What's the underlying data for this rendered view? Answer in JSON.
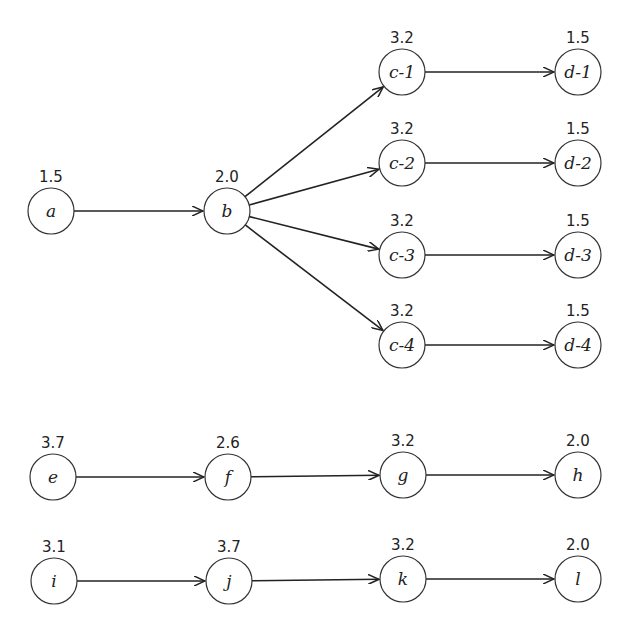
{
  "diagram": {
    "type": "directed-graph",
    "node_radius": 23,
    "nodes": [
      {
        "id": "a",
        "label": "a",
        "weight": "1.5",
        "x": 51,
        "y": 211
      },
      {
        "id": "b",
        "label": "b",
        "weight": "2.0",
        "x": 227,
        "y": 211
      },
      {
        "id": "c-1",
        "label": "c-1",
        "weight": "3.2",
        "x": 402,
        "y": 72
      },
      {
        "id": "c-2",
        "label": "c-2",
        "weight": "3.2",
        "x": 402,
        "y": 163
      },
      {
        "id": "c-3",
        "label": "c-3",
        "weight": "3.2",
        "x": 402,
        "y": 255
      },
      {
        "id": "c-4",
        "label": "c-4",
        "weight": "3.2",
        "x": 402,
        "y": 345
      },
      {
        "id": "d-1",
        "label": "d-1",
        "weight": "1.5",
        "x": 578,
        "y": 72
      },
      {
        "id": "d-2",
        "label": "d-2",
        "weight": "1.5",
        "x": 578,
        "y": 163
      },
      {
        "id": "d-3",
        "label": "d-3",
        "weight": "1.5",
        "x": 578,
        "y": 255
      },
      {
        "id": "d-4",
        "label": "d-4",
        "weight": "1.5",
        "x": 578,
        "y": 345
      },
      {
        "id": "e",
        "label": "e",
        "weight": "3.7",
        "x": 53,
        "y": 477
      },
      {
        "id": "f",
        "label": "f",
        "weight": "2.6",
        "x": 228,
        "y": 477
      },
      {
        "id": "g",
        "label": "g",
        "weight": "3.2",
        "x": 403,
        "y": 475
      },
      {
        "id": "h",
        "label": "h",
        "weight": "2.0",
        "x": 578,
        "y": 475
      },
      {
        "id": "i",
        "label": "i",
        "weight": "3.1",
        "x": 54,
        "y": 581
      },
      {
        "id": "j",
        "label": "j",
        "weight": "3.7",
        "x": 229,
        "y": 581
      },
      {
        "id": "k",
        "label": "k",
        "weight": "3.2",
        "x": 403,
        "y": 579
      },
      {
        "id": "l",
        "label": "l",
        "weight": "2.0",
        "x": 578,
        "y": 579
      }
    ],
    "edges": [
      {
        "from": "a",
        "to": "b"
      },
      {
        "from": "b",
        "to": "c-1"
      },
      {
        "from": "b",
        "to": "c-2"
      },
      {
        "from": "b",
        "to": "c-3"
      },
      {
        "from": "b",
        "to": "c-4"
      },
      {
        "from": "c-1",
        "to": "d-1"
      },
      {
        "from": "c-2",
        "to": "d-2"
      },
      {
        "from": "c-3",
        "to": "d-3"
      },
      {
        "from": "c-4",
        "to": "d-4"
      },
      {
        "from": "e",
        "to": "f"
      },
      {
        "from": "f",
        "to": "g"
      },
      {
        "from": "g",
        "to": "h"
      },
      {
        "from": "i",
        "to": "j"
      },
      {
        "from": "j",
        "to": "k"
      },
      {
        "from": "k",
        "to": "l"
      }
    ]
  }
}
